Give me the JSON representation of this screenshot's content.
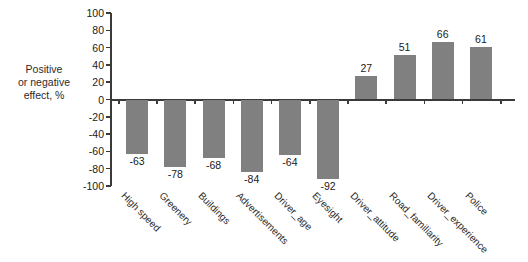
{
  "chart_data": {
    "type": "bar",
    "title": "",
    "xlabel": "",
    "ylabel": "Positive or negative effect, %",
    "ylabel_lines": [
      "Positive",
      "or negative",
      "effect, %"
    ],
    "ylim": [
      -100,
      100
    ],
    "yticks": [
      100,
      80,
      60,
      40,
      20,
      0,
      -20,
      -40,
      -60,
      -80,
      -100
    ],
    "ytick_labels": [
      "100",
      "80",
      "60",
      "40",
      "20",
      "0",
      "-20",
      "-40",
      "-60",
      "-80",
      "-100"
    ],
    "grid": false,
    "legend": "none",
    "bar_color": "#808080",
    "axis_color": "#3a3a3a",
    "categories": [
      "High speed",
      "Greenery",
      "Buildings",
      "Advertisements",
      "Driver_age",
      "Eyesight",
      "Driver_attitude",
      "Road_familiarity",
      "Driver_experience",
      "Police"
    ],
    "values": [
      -63,
      -78,
      -68,
      -84,
      -64,
      -92,
      27,
      51,
      66,
      61
    ],
    "data_labels": [
      "-63",
      "-78",
      "-68",
      "-84",
      "-64",
      "-92",
      "27",
      "51",
      "66",
      "61"
    ]
  }
}
